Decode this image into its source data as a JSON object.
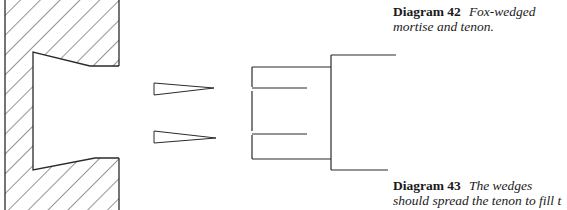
{
  "figure": {
    "caption_42": {
      "label": "Diagram 42",
      "line1": "Fox-wedged",
      "line2": "mortise and tenon."
    },
    "caption_43": {
      "label": "Diagram 43",
      "line1": "The wedges",
      "line2": "should spread the tenon to fill t"
    },
    "parts": [
      "mortise-block-hatched",
      "wedge-top",
      "wedge-bottom",
      "slotted-tenon",
      "rail"
    ],
    "colors": {
      "line": "#2a2a2a",
      "background": "#ffffff"
    }
  }
}
